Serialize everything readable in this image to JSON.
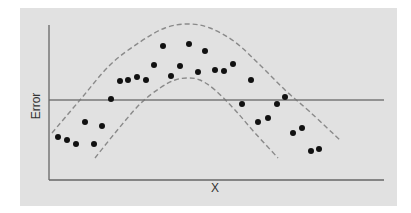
{
  "chart_data": {
    "type": "scatter",
    "title": "",
    "xlabel": "X",
    "ylabel": "Error",
    "grid": false,
    "legend": null,
    "x_tick_labels": [],
    "y_tick_labels": [],
    "reference_line": {
      "orientation": "horizontal",
      "y_pixel": 100,
      "description": "zero-error baseline"
    },
    "points_pixel": [
      [
        58,
        137
      ],
      [
        67,
        140
      ],
      [
        76,
        144
      ],
      [
        85,
        122
      ],
      [
        94,
        144
      ],
      [
        102,
        126
      ],
      [
        111,
        99
      ],
      [
        120,
        81
      ],
      [
        128,
        80
      ],
      [
        137,
        77
      ],
      [
        146,
        80
      ],
      [
        154,
        65
      ],
      [
        163,
        46
      ],
      [
        171,
        76
      ],
      [
        180,
        66
      ],
      [
        189,
        44
      ],
      [
        198,
        72
      ],
      [
        205,
        51
      ],
      [
        215,
        70
      ],
      [
        224,
        71
      ],
      [
        233,
        64
      ],
      [
        242,
        104
      ],
      [
        251,
        80
      ],
      [
        258,
        122
      ],
      [
        268,
        118
      ],
      [
        277,
        104
      ],
      [
        285,
        97
      ],
      [
        293,
        133
      ],
      [
        302,
        128
      ],
      [
        311,
        151
      ],
      [
        319,
        149
      ]
    ],
    "series": [
      {
        "name": "upper confidence band",
        "style": "dashed",
        "path_pixel": [
          [
            52,
            133
          ],
          [
            80,
            100
          ],
          [
            110,
            65
          ],
          [
            140,
            42
          ],
          [
            165,
            28
          ],
          [
            188,
            24
          ],
          [
            210,
            28
          ],
          [
            235,
            42
          ],
          [
            260,
            65
          ],
          [
            285,
            90
          ],
          [
            310,
            112
          ],
          [
            341,
            141
          ]
        ]
      },
      {
        "name": "lower confidence band",
        "style": "dashed",
        "path_pixel": [
          [
            95,
            158
          ],
          [
            115,
            133
          ],
          [
            140,
            104
          ],
          [
            160,
            88
          ],
          [
            175,
            80
          ],
          [
            188,
            78
          ],
          [
            200,
            80
          ],
          [
            215,
            90
          ],
          [
            235,
            110
          ],
          [
            255,
            133
          ],
          [
            278,
            158
          ]
        ]
      }
    ],
    "axis_range_pixel": {
      "x": [
        49,
        384
      ],
      "y": [
        25,
        180
      ]
    }
  },
  "colors": {
    "background": "#e1e1e1",
    "axis": "#666666",
    "reference_line": "#777777",
    "points": "#111111",
    "dashed": "#8a8a8a"
  }
}
